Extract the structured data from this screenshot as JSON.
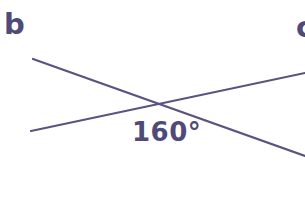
{
  "figure": {
    "type": "geometry-diagram",
    "width": 305,
    "height": 209,
    "background_color": "#ffffff",
    "stroke_color": "#5a5380",
    "text_color": "#4f4a78",
    "stroke_width": 2.2
  },
  "labels": {
    "part_b": "b",
    "part_c": "c",
    "angle_value": "160°"
  },
  "geometry": {
    "intersection": {
      "x": 161,
      "y": 104
    },
    "lines": [
      {
        "name": "line-descending",
        "x1": 33,
        "y1": 59,
        "x2": 305,
        "y2": 156
      },
      {
        "name": "line-ascending",
        "x1": 31,
        "y1": 131,
        "x2": 305,
        "y2": 73
      }
    ]
  },
  "chart_data": {
    "type": "diagram",
    "title": "b",
    "annotations": [
      "160°"
    ],
    "shapes": [
      {
        "kind": "line",
        "from": [
          33,
          59
        ],
        "to": [
          305,
          156
        ]
      },
      {
        "kind": "line",
        "from": [
          31,
          131
        ],
        "to": [
          305,
          73
        ]
      }
    ],
    "marked_angle_degrees": 160,
    "marked_angle_vertex": [
      161,
      104
    ],
    "marked_angle_label_position": [
      132,
      119
    ]
  }
}
